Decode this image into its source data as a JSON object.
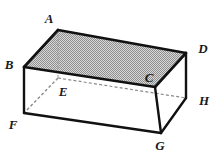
{
  "figure": {
    "name": "rectangular-prism-diagram",
    "canvas": {
      "width": 219,
      "height": 153
    },
    "colors": {
      "background": "#ffffff",
      "stroke": "#111111",
      "hidden_stroke": "#8a8a8a",
      "top_face_fill": "#bfbfbf",
      "side_face_fill": "#ffffff",
      "label_color": "#1a1a1a"
    },
    "stroke_widths": {
      "visible_edge": 2.4,
      "hidden_edge": 1.1,
      "faint_edge": 1.0
    },
    "vertices": [
      {
        "id": "A",
        "x": 58,
        "y": 30,
        "label_x": 49,
        "label_y": 18,
        "hidden": false
      },
      {
        "id": "B",
        "x": 24,
        "y": 67,
        "label_x": 9,
        "label_y": 64,
        "hidden": false
      },
      {
        "id": "C",
        "x": 155,
        "y": 87,
        "label_x": 149,
        "label_y": 77,
        "hidden": false
      },
      {
        "id": "D",
        "x": 186,
        "y": 53,
        "label_x": 203,
        "label_y": 48,
        "hidden": false
      },
      {
        "id": "E",
        "x": 58,
        "y": 78,
        "label_x": 63,
        "label_y": 91,
        "hidden": true
      },
      {
        "id": "F",
        "x": 24,
        "y": 113,
        "label_x": 13,
        "label_y": 124,
        "hidden": false
      },
      {
        "id": "G",
        "x": 161,
        "y": 133,
        "label_x": 160,
        "label_y": 145,
        "hidden": false
      },
      {
        "id": "H",
        "x": 186,
        "y": 98,
        "label_x": 204,
        "label_y": 100,
        "hidden": false
      }
    ],
    "faces": [
      {
        "id": "top-face",
        "vertices": [
          "A",
          "D",
          "C",
          "B"
        ],
        "fill": "shaded",
        "pattern": "stipple"
      },
      {
        "id": "front-face",
        "vertices": [
          "B",
          "C",
          "G",
          "F"
        ],
        "fill": "white",
        "pattern": "none"
      },
      {
        "id": "right-face",
        "vertices": [
          "C",
          "D",
          "H",
          "G"
        ],
        "fill": "white",
        "pattern": "none"
      }
    ],
    "visible_edges": [
      {
        "id": "edge-AB",
        "from": "A",
        "to": "B"
      },
      {
        "id": "edge-AD",
        "from": "A",
        "to": "D"
      },
      {
        "id": "edge-BC",
        "from": "B",
        "to": "C"
      },
      {
        "id": "edge-CD",
        "from": "C",
        "to": "D"
      },
      {
        "id": "edge-BF",
        "from": "B",
        "to": "F"
      },
      {
        "id": "edge-CG",
        "from": "C",
        "to": "G"
      },
      {
        "id": "edge-DH",
        "from": "D",
        "to": "H"
      },
      {
        "id": "edge-FG",
        "from": "F",
        "to": "G"
      },
      {
        "id": "edge-GH",
        "from": "G",
        "to": "H"
      }
    ],
    "hidden_edges": [
      {
        "id": "edge-EF",
        "from": "E",
        "to": "F"
      },
      {
        "id": "edge-EH",
        "from": "E",
        "to": "H"
      },
      {
        "id": "edge-AE",
        "from": "A",
        "to": "E"
      }
    ]
  }
}
